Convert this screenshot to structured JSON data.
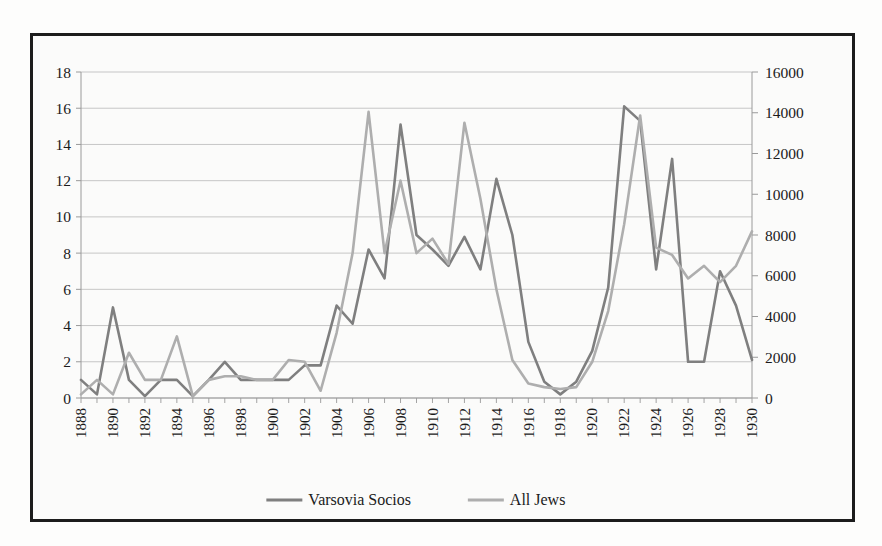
{
  "chart_data": {
    "type": "line",
    "title": "",
    "xlabel": "",
    "ylabel": "",
    "y_left_label": "",
    "y_right_label": "",
    "grid": true,
    "legend_position": "bottom",
    "x": [
      1888,
      1889,
      1890,
      1891,
      1892,
      1893,
      1894,
      1895,
      1896,
      1897,
      1898,
      1899,
      1900,
      1901,
      1902,
      1903,
      1904,
      1905,
      1906,
      1907,
      1908,
      1909,
      1910,
      1911,
      1912,
      1913,
      1914,
      1915,
      1916,
      1917,
      1918,
      1919,
      1920,
      1921,
      1922,
      1923,
      1924,
      1925,
      1926,
      1927,
      1928,
      1929,
      1930
    ],
    "xticklabels": [
      "1888",
      "1890",
      "1892",
      "1894",
      "1896",
      "1898",
      "1900",
      "1902",
      "1904",
      "1906",
      "1908",
      "1910",
      "1912",
      "1914",
      "1916",
      "1918",
      "1920",
      "1922",
      "1924",
      "1926",
      "1928",
      "1930"
    ],
    "xtick_step": 2,
    "ylim": [
      0,
      18
    ],
    "yticks": [
      0,
      2,
      4,
      6,
      8,
      10,
      12,
      14,
      16,
      18
    ],
    "yticklabels": [
      "0",
      "2",
      "4",
      "6",
      "8",
      "10",
      "12",
      "14",
      "16",
      "18"
    ],
    "y2lim": [
      0,
      16000
    ],
    "y2ticks": [
      0,
      2000,
      4000,
      6000,
      8000,
      10000,
      12000,
      14000,
      16000
    ],
    "y2ticklabels": [
      "0",
      "2000",
      "4000",
      "6000",
      "8000",
      "10000",
      "12000",
      "14000",
      "16000"
    ],
    "series": [
      {
        "name": "Varsovia Socios",
        "axis": "left",
        "color": "#7f7f7f",
        "values": [
          1.0,
          0.2,
          5.0,
          1.0,
          0.1,
          1.0,
          1.0,
          0.1,
          1.0,
          2.0,
          1.0,
          1.0,
          1.0,
          1.0,
          1.8,
          1.8,
          5.1,
          4.1,
          8.2,
          6.6,
          15.1,
          9.0,
          8.2,
          7.3,
          8.9,
          7.1,
          12.1,
          9.0,
          3.1,
          0.9,
          0.2,
          0.9,
          2.6,
          6.1,
          16.1,
          15.3,
          7.1,
          13.2,
          2.0,
          2.0,
          7.0,
          5.1,
          2.1
        ]
      },
      {
        "name": "All Jews",
        "axis": "right",
        "color": "#aeaeae",
        "values": [
          0.2,
          1.0,
          0.2,
          2.5,
          1.0,
          1.0,
          3.4,
          0.1,
          1.0,
          1.2,
          1.2,
          1.0,
          1.0,
          2.1,
          2.0,
          0.4,
          3.6,
          8.0,
          15.8,
          8.0,
          12.0,
          8.0,
          8.8,
          7.4,
          15.2,
          11.0,
          6.0,
          2.1,
          0.8,
          0.6,
          0.5,
          0.6,
          2.0,
          4.8,
          9.6,
          15.6,
          8.3,
          7.9,
          6.6,
          7.3,
          6.4,
          7.3,
          9.2
        ]
      }
    ]
  },
  "legend": {
    "entries": [
      {
        "label": "Varsovia Socios",
        "color": "#7f7f7f"
      },
      {
        "label": "All Jews",
        "color": "#aeaeae"
      }
    ]
  }
}
